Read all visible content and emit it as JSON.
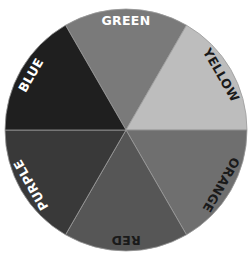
{
  "diagram": {
    "type": "color-wheel",
    "center": [
      126,
      130
    ],
    "radius": 121,
    "segments": [
      {
        "name": "GREEN",
        "label": "GREEN",
        "fill": "#7a7a7a",
        "text_color": "#ffffff",
        "start_deg": -120,
        "end_deg": -60
      },
      {
        "name": "YELLOW",
        "label": "YELLOW",
        "fill": "#bdbdbd",
        "text_color": "#1a1a1a",
        "start_deg": -60,
        "end_deg": 0
      },
      {
        "name": "ORANGE",
        "label": "ORANGE",
        "fill": "#6f6f6f",
        "text_color": "#1a1a1a",
        "start_deg": 0,
        "end_deg": 60
      },
      {
        "name": "RED",
        "label": "RED",
        "fill": "#565656",
        "text_color": "#1a1a1a",
        "start_deg": 60,
        "end_deg": 120
      },
      {
        "name": "PURPLE",
        "label": "PURPLE",
        "fill": "#393939",
        "text_color": "#ffffff",
        "start_deg": 120,
        "end_deg": 180
      },
      {
        "name": "BLUE",
        "label": "BLUE",
        "fill": "#1f1f1f",
        "text_color": "#ffffff",
        "start_deg": 180,
        "end_deg": 240
      }
    ]
  }
}
